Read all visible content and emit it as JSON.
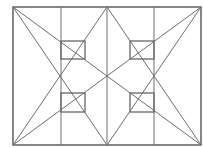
{
  "diagram": {
    "title": "",
    "stroke_color": "#6e6e6e",
    "background": "#ffffff",
    "frame": {
      "x1": 13,
      "y1": 7,
      "x2": 201,
      "y2": 145
    },
    "vertical_lines_x": [
      61,
      107,
      154
    ],
    "key_points": {
      "top_left": [
        13,
        7
      ],
      "top_center": [
        107,
        7
      ],
      "top_right": [
        201,
        7
      ],
      "bottom_left": [
        13,
        145
      ],
      "bottom_center": [
        107,
        145
      ],
      "bottom_right": [
        201,
        145
      ],
      "left_mid": [
        61,
        76
      ],
      "center": [
        107,
        76
      ],
      "right_mid": [
        154,
        76
      ]
    },
    "lines": [
      [
        13,
        7,
        201,
        145
      ],
      [
        201,
        7,
        13,
        145
      ],
      [
        13,
        7,
        107,
        145
      ],
      [
        107,
        7,
        13,
        145
      ],
      [
        107,
        7,
        201,
        145
      ],
      [
        201,
        7,
        107,
        145
      ]
    ],
    "squares": [
      {
        "x": 61,
        "y": 41,
        "w": 24,
        "h": 18
      },
      {
        "x": 61,
        "y": 93,
        "w": 24,
        "h": 19
      },
      {
        "x": 130,
        "y": 41,
        "w": 24,
        "h": 18
      },
      {
        "x": 130,
        "y": 93,
        "w": 24,
        "h": 19
      }
    ]
  }
}
